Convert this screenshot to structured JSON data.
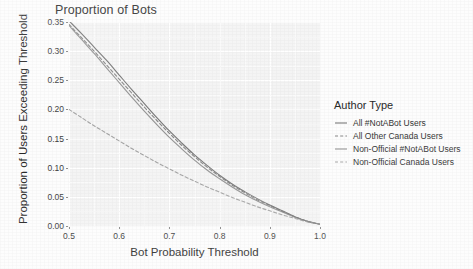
{
  "chart_data": {
    "type": "line",
    "title": "Proportion of Bots",
    "xlabel": "Bot Probability Threshold",
    "ylabel": "Proportion of Users Exceeding Threshold",
    "xlim": [
      0.5,
      1.0
    ],
    "ylim": [
      0.0,
      0.35
    ],
    "xticks": [
      "0.5",
      "0.6",
      "0.7",
      "0.8",
      "0.9",
      "1.0"
    ],
    "xtick_values": [
      0.5,
      0.6,
      0.7,
      0.8,
      0.9,
      1.0
    ],
    "yticks": [
      "0.00",
      "0.05",
      "0.10",
      "0.15",
      "0.20",
      "0.25",
      "0.30",
      "0.35"
    ],
    "ytick_values": [
      0.0,
      0.05,
      0.1,
      0.15,
      0.2,
      0.25,
      0.3,
      0.35
    ],
    "grid": true,
    "legend_position": "right",
    "legend_title": "Author Type",
    "x": [
      0.5,
      0.525,
      0.55,
      0.575,
      0.6,
      0.625,
      0.65,
      0.675,
      0.7,
      0.725,
      0.75,
      0.775,
      0.8,
      0.825,
      0.85,
      0.875,
      0.9,
      0.925,
      0.95,
      0.975,
      1.0
    ],
    "series": [
      {
        "name": "All #NotABot Users",
        "style": "solid",
        "color": "#595959",
        "values": [
          0.352,
          0.33,
          0.307,
          0.284,
          0.259,
          0.234,
          0.21,
          0.186,
          0.163,
          0.142,
          0.122,
          0.104,
          0.087,
          0.072,
          0.059,
          0.047,
          0.036,
          0.026,
          0.016,
          0.008,
          0.003
        ]
      },
      {
        "name": "All Other Canada Users",
        "style": "dashed",
        "color": "#6e6e6e",
        "values": [
          0.346,
          0.323,
          0.3,
          0.276,
          0.252,
          0.228,
          0.204,
          0.181,
          0.159,
          0.138,
          0.119,
          0.101,
          0.085,
          0.07,
          0.057,
          0.045,
          0.035,
          0.025,
          0.016,
          0.008,
          0.003
        ]
      },
      {
        "name": "Non-Official #NotABot Users",
        "style": "solid",
        "color": "#7d7d7d",
        "values": [
          0.344,
          0.32,
          0.296,
          0.271,
          0.246,
          0.221,
          0.197,
          0.174,
          0.152,
          0.132,
          0.113,
          0.096,
          0.081,
          0.067,
          0.054,
          0.043,
          0.033,
          0.024,
          0.015,
          0.008,
          0.003
        ]
      },
      {
        "name": "Non-Official Canada Users",
        "style": "dashed",
        "color": "#919191",
        "values": [
          0.2,
          0.186,
          0.172,
          0.159,
          0.146,
          0.133,
          0.121,
          0.109,
          0.098,
          0.087,
          0.077,
          0.067,
          0.058,
          0.049,
          0.041,
          0.033,
          0.026,
          0.019,
          0.013,
          0.007,
          0.003
        ]
      }
    ]
  },
  "legend": {
    "title": "Author Type",
    "items": [
      {
        "label": "All #NotABot Users"
      },
      {
        "label": "All Other Canada Users"
      },
      {
        "label": "Non-Official #NotABot Users"
      },
      {
        "label": "Non-Official Canada Users"
      }
    ]
  }
}
